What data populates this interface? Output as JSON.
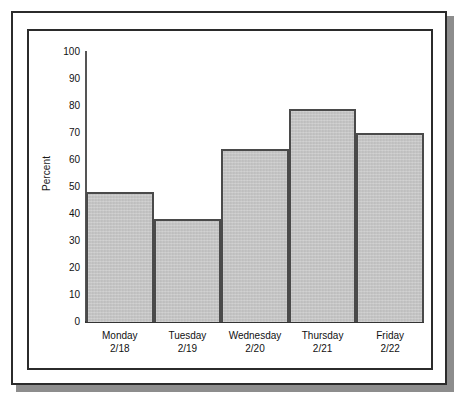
{
  "figure": {
    "frame_style": "double-border-with-drop-shadow",
    "background_color": "#ffffff",
    "frame_color": "#2b2b2b",
    "shadow_color": "#8d8d8d"
  },
  "chart_data": {
    "type": "bar",
    "title": "",
    "subtitle": "",
    "xlabel": "",
    "ylabel": "Percent",
    "categories": [
      "Monday",
      "Tuesday",
      "Wednesday",
      "Thursday",
      "Friday"
    ],
    "category_sublabels": [
      "2/18",
      "2/19",
      "2/20",
      "2/21",
      "2/22"
    ],
    "values": [
      48,
      38,
      64,
      79,
      70
    ],
    "ylim": [
      0,
      100
    ],
    "ytick_step": 10,
    "yticks": [
      100,
      90,
      80,
      70,
      60,
      50,
      40,
      30,
      20,
      10,
      0
    ],
    "ytick_labels": [
      "100",
      "90",
      "80",
      "70",
      "60",
      "50",
      "40",
      "30",
      "20",
      "10",
      "0"
    ],
    "grid": false,
    "legend": false,
    "legend_position": "none",
    "bar_gap": 0,
    "bar_fill_color": "#c6c6c6",
    "bar_edge_color": "#4a4a4a",
    "axis_color": "#333333"
  }
}
